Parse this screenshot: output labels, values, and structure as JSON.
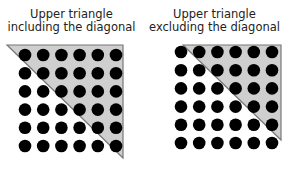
{
  "diagram": {
    "panels": [
      {
        "title_line1": "Upper triangle",
        "title_line2": "including the diagonal",
        "grid_size": 6,
        "includes_diagonal": true
      },
      {
        "title_line1": "Upper triangle",
        "title_line2": "excluding the diagonal",
        "grid_size": 6,
        "includes_diagonal": false
      }
    ],
    "colors": {
      "triangle_fill": "#cfcfcf",
      "triangle_stroke": "#777777",
      "dot": "#000000"
    }
  }
}
